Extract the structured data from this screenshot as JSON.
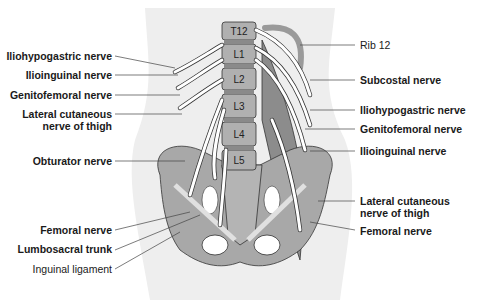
{
  "diagram": {
    "vertebrae": [
      "T12",
      "L1",
      "L2",
      "L3",
      "L4",
      "L5"
    ],
    "labels_left": [
      {
        "text": "Iliohypogastric nerve",
        "bold": true
      },
      {
        "text": "Ilioinguinal nerve",
        "bold": true
      },
      {
        "text": "Genitofemoral nerve",
        "bold": true
      },
      {
        "text": "Lateral cutaneous",
        "bold": true
      },
      {
        "text": "nerve of thigh",
        "bold": true
      },
      {
        "text": "Obturator nerve",
        "bold": true
      },
      {
        "text": "Femoral nerve",
        "bold": true
      },
      {
        "text": "Lumbosacral trunk",
        "bold": true
      },
      {
        "text": "Inguinal ligament",
        "bold": false
      }
    ],
    "labels_right": [
      {
        "text": "Rib 12",
        "bold": false
      },
      {
        "text": "Subcostal nerve",
        "bold": true
      },
      {
        "text": "Iliohypogastric nerve",
        "bold": true
      },
      {
        "text": "Genitofemoral nerve",
        "bold": true
      },
      {
        "text": "Ilioinguinal nerve",
        "bold": true
      },
      {
        "text": "Lateral cutaneous",
        "bold": true
      },
      {
        "text": "nerve of thigh",
        "bold": true
      },
      {
        "text": "Femoral nerve",
        "bold": true
      }
    ],
    "colors": {
      "body_bg": "#eeeeee",
      "bone": "#a8a8a8",
      "muscle": "#8c8c8c",
      "nerve": "#ffffff",
      "outline": "#333333"
    }
  }
}
